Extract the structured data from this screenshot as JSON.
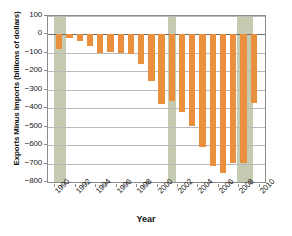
{
  "chart_data": {
    "type": "bar",
    "title": "",
    "xlabel": "Year",
    "ylabel": "Exports Minus Imports (billions of  dollars)",
    "ylim": [
      -800,
      100
    ],
    "ytick_labels": [
      "100",
      "0",
      "−100",
      "−200",
      "−300",
      "−400",
      "−500",
      "−600",
      "−700",
      "−800"
    ],
    "ytick_values": [
      100,
      0,
      -100,
      -200,
      -300,
      -400,
      -500,
      -600,
      -700,
      -800
    ],
    "xtick_labels": [
      "1990",
      "1992",
      "1994",
      "1996",
      "1998",
      "2000",
      "2002",
      "2004",
      "2006",
      "2008",
      "2010"
    ],
    "xtick_values": [
      1990,
      1992,
      1994,
      1996,
      1998,
      2000,
      2002,
      2004,
      2006,
      2008,
      2010
    ],
    "xlim": [
      1989.4,
      2010.6
    ],
    "grid": true,
    "legend": false,
    "bar_color": "#ea8f3d",
    "recession_band_color": "#c2c8ac",
    "categories": [
      1990,
      1991,
      1992,
      1993,
      1994,
      1995,
      1996,
      1997,
      1998,
      1999,
      2000,
      2001,
      2002,
      2003,
      2004,
      2005,
      2006,
      2007,
      2008,
      2009
    ],
    "values": [
      -77,
      -21,
      -38,
      -63,
      -98,
      -96,
      -101,
      -105,
      -160,
      -255,
      -375,
      -360,
      -420,
      -494,
      -610,
      -711,
      -753,
      -697,
      -698,
      -370
    ],
    "annotations": [
      {
        "label": "recession-band-1990",
        "x_start": 1990.0,
        "x_end": 1991.2
      },
      {
        "label": "recession-band-2001",
        "x_start": 2001.1,
        "x_end": 2001.9
      },
      {
        "label": "recession-band-2008",
        "x_start": 2007.9,
        "x_end": 2009.4
      }
    ]
  }
}
